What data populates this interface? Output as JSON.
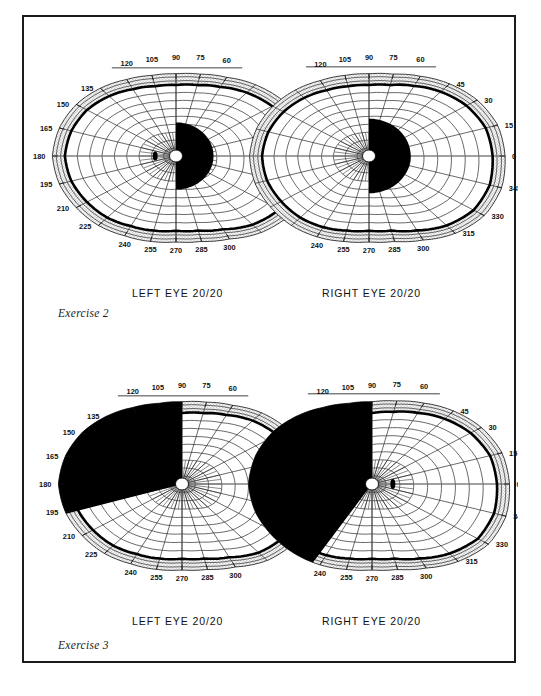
{
  "page": {
    "kind": "visual-field-perimetry-plate",
    "background": "#ffffff",
    "frame_color": "#1b1b1b"
  },
  "palette": {
    "ink": "#111111",
    "grid": "#2a2a2a",
    "scotoma_fill": "#000000",
    "periphery_hatch": "#c9c9c9",
    "paper": "#ffffff"
  },
  "exercises": [
    {
      "id": "exercise-2",
      "label": "Exercise 2",
      "eyes": [
        {
          "side": "left",
          "caption": "LEFT EYE   20/20",
          "eye_label": "LEFT EYE",
          "acuity": "20/20",
          "blind_spot": {
            "angle_deg": 180,
            "radius_deg": 15,
            "w": 5,
            "h": 9
          },
          "defect": {
            "type": "central-hemi-scotoma",
            "description": "dense black half-disc nasal/right of fixation",
            "start_deg": -90,
            "end_deg": 90,
            "radius_deg": 27
          }
        },
        {
          "side": "right",
          "caption": "RIGHT EYE   20/20",
          "eye_label": "RIGHT EYE",
          "acuity": "20/20",
          "blind_spot": null,
          "defect": {
            "type": "central-hemi-scotoma",
            "description": "dense black half-disc temporal/right of fixation",
            "start_deg": -90,
            "end_deg": 90,
            "radius_deg": 30
          }
        }
      ]
    },
    {
      "id": "exercise-3",
      "label": "Exercise 3",
      "eyes": [
        {
          "side": "left",
          "caption": "LEFT EYE   20/20",
          "eye_label": "LEFT EYE",
          "acuity": "20/20",
          "blind_spot": {
            "angle_deg": 180,
            "radius_deg": 15,
            "w": 5,
            "h": 10
          },
          "defect": {
            "type": "superior-nasal-quadrantic-wedge",
            "description": "large black wedge occupying upper-left quadrant out to periphery",
            "start_deg": 90,
            "end_deg": 196,
            "radius_deg": 90
          }
        },
        {
          "side": "right",
          "caption": "RIGHT EYE   20/20",
          "eye_label": "RIGHT EYE",
          "acuity": "20/20",
          "blind_spot": {
            "angle_deg": 0,
            "radius_deg": 15,
            "w": 5,
            "h": 10
          },
          "defect": {
            "type": "hemianopic-left-field-loss",
            "description": "dense black region filling entire left hemifield with sparing notch at 240",
            "start_deg": 90,
            "end_deg": 236,
            "radius_deg": 95
          }
        }
      ]
    }
  ],
  "scale": {
    "meridian_labels_top": [
      "120",
      "105",
      "90",
      "75",
      "60"
    ],
    "meridian_labels_bottom": [
      "240",
      "255",
      "270",
      "285",
      "300"
    ],
    "meridian_labels_left": [
      "135",
      "150",
      "165",
      "180",
      "195",
      "210",
      "225"
    ],
    "meridian_labels_right": [
      "45",
      "30",
      "15",
      "0",
      "345",
      "330",
      "315"
    ],
    "isopter_rings_deg": [
      10,
      20,
      30,
      40,
      50,
      60,
      70,
      80,
      90
    ],
    "ring_step_deg": 10,
    "meridian_step_deg": 15
  },
  "chart_data": {
    "type": "scatter",
    "xlabel": "Meridian (degrees)",
    "ylabel": "Eccentricity (degrees)",
    "axis_type": "polar",
    "grid": true,
    "legend": "none",
    "rlim": [
      0,
      90
    ],
    "r_ticks": [
      10,
      20,
      30,
      40,
      50,
      60,
      70,
      80,
      90
    ],
    "theta_ticks": [
      0,
      15,
      30,
      45,
      60,
      75,
      90,
      105,
      120,
      135,
      150,
      165,
      180,
      195,
      210,
      225,
      240,
      255,
      270,
      285,
      300,
      315,
      330,
      345
    ],
    "series": [
      {
        "name": "Exercise 2 — Left eye isopter (deg eccentricity by meridian)",
        "categories": [
          0,
          15,
          30,
          45,
          60,
          75,
          90,
          105,
          120,
          135,
          150,
          165,
          180,
          195,
          210,
          225,
          240,
          255,
          270,
          285,
          300,
          315,
          330,
          345
        ],
        "values": [
          88,
          86,
          80,
          72,
          64,
          59,
          57,
          58,
          62,
          68,
          74,
          78,
          80,
          78,
          74,
          70,
          65,
          62,
          60,
          62,
          68,
          78,
          86,
          89
        ]
      },
      {
        "name": "Exercise 2 — Right eye isopter",
        "categories": [
          0,
          15,
          30,
          45,
          60,
          75,
          90,
          105,
          120,
          135,
          150,
          165,
          180,
          195,
          210,
          225,
          240,
          255,
          270,
          285,
          300,
          315,
          330,
          345
        ],
        "values": [
          89,
          87,
          81,
          73,
          65,
          59,
          57,
          58,
          61,
          66,
          71,
          75,
          77,
          76,
          73,
          70,
          66,
          62,
          60,
          62,
          69,
          79,
          87,
          90
        ]
      },
      {
        "name": "Exercise 3 — Left eye isopter",
        "categories": [
          0,
          15,
          30,
          45,
          60,
          75,
          90,
          105,
          120,
          135,
          150,
          165,
          180,
          195,
          210,
          225,
          240,
          255,
          270,
          285,
          300,
          315,
          330,
          345
        ],
        "values": [
          86,
          84,
          79,
          72,
          64,
          59,
          57,
          58,
          62,
          68,
          74,
          78,
          80,
          78,
          74,
          70,
          65,
          62,
          60,
          62,
          68,
          78,
          85,
          87
        ]
      },
      {
        "name": "Exercise 3 — Right eye isopter",
        "categories": [
          0,
          15,
          30,
          45,
          60,
          75,
          90,
          105,
          120,
          135,
          150,
          165,
          180,
          195,
          210,
          225,
          240,
          255,
          270,
          285,
          300,
          315,
          330,
          345
        ],
        "values": [
          90,
          88,
          82,
          74,
          66,
          60,
          57,
          58,
          62,
          68,
          74,
          78,
          80,
          78,
          74,
          70,
          66,
          62,
          60,
          62,
          69,
          79,
          88,
          91
        ]
      }
    ],
    "annotations": [
      {
        "text": "Exercise 2",
        "role": "plate-label"
      },
      {
        "text": "Exercise 3",
        "role": "plate-label"
      },
      {
        "text": "LEFT EYE   20/20",
        "role": "eye-caption"
      },
      {
        "text": "RIGHT EYE   20/20",
        "role": "eye-caption"
      }
    ]
  }
}
